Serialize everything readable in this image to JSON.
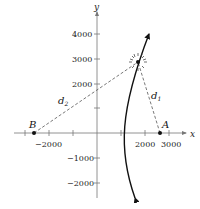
{
  "diagram": {
    "type": "hyperbola-locator",
    "axes": {
      "x_label": "x",
      "y_label": "y",
      "x_ticks": [
        {
          "value": -3000,
          "label": ""
        },
        {
          "value": -2000,
          "label": "−2000"
        },
        {
          "value": -1000,
          "label": ""
        },
        {
          "value": 1000,
          "label": ""
        },
        {
          "value": 2000,
          "label": "2000"
        },
        {
          "value": 3000,
          "label": "3000"
        }
      ],
      "y_ticks": [
        {
          "value": 4000,
          "label": "4000"
        },
        {
          "value": 3000,
          "label": "3000"
        },
        {
          "value": 2000,
          "label": "2000"
        },
        {
          "value": 1000,
          "label": ""
        },
        {
          "value": -1000,
          "label": "−1000"
        },
        {
          "value": -2000,
          "label": "−2000"
        }
      ]
    },
    "points": {
      "A": {
        "label": "A",
        "x": 2600,
        "y": 0
      },
      "B": {
        "label": "B",
        "x": -2600,
        "y": 0
      },
      "source": {
        "label": "",
        "x": 1700,
        "y": 2900,
        "marker": "burst"
      }
    },
    "segments": {
      "d1": {
        "label": "d",
        "sub": "1",
        "from": "source",
        "to": "A",
        "style": "dashed"
      },
      "d2": {
        "label": "d",
        "sub": "2",
        "from": "source",
        "to": "B",
        "style": "dashed"
      }
    },
    "curve": {
      "kind": "hyperbola branch",
      "arrows": "both ends"
    }
  }
}
